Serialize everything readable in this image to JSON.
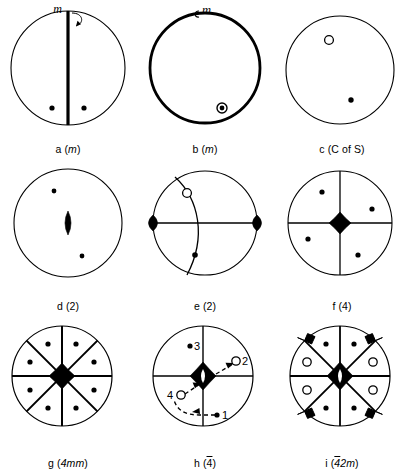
{
  "figure": {
    "rows": 3,
    "columns": 3,
    "background_color": "#ffffff",
    "line_color": "#000000"
  },
  "panels": [
    {
      "id": "a",
      "caption_letter": "a",
      "caption_symbol": "m",
      "caption_full": "a (m)",
      "symmetry": "m",
      "annotation_label": "m",
      "description": "circle with vertical mirror line and two related points",
      "circle_stroke_px": 1,
      "points": [
        {
          "type": "filled-dot",
          "label": ""
        },
        {
          "type": "filled-dot",
          "label": ""
        }
      ]
    },
    {
      "id": "b",
      "caption_letter": "b",
      "caption_symbol": "m",
      "caption_full": "b (m)",
      "symmetry": "m",
      "annotation_label": "m",
      "description": "bold circle (mirror plane in plane of page) with superimposed point pair",
      "circle_stroke_px": 2.6,
      "points": [
        {
          "type": "dot-in-ring",
          "label": ""
        }
      ]
    },
    {
      "id": "c",
      "caption_letter": "c",
      "caption_symbol": "C of S",
      "caption_full": "c (C of S)",
      "symmetry": "centre of symmetry",
      "annotation_label": "",
      "description": "circle with one open circle and one filled dot related by inversion",
      "circle_stroke_px": 1,
      "points": [
        {
          "type": "open-circle",
          "label": ""
        },
        {
          "type": "filled-dot",
          "label": ""
        }
      ]
    },
    {
      "id": "d",
      "caption_letter": "d",
      "caption_symbol": "2",
      "caption_full": "d (2)",
      "symmetry": "2",
      "annotation_label": "",
      "description": "circle with 2-fold lens symbol at centre and two related dots",
      "circle_stroke_px": 1,
      "points": [
        {
          "type": "filled-dot",
          "label": ""
        },
        {
          "type": "filled-dot",
          "label": ""
        }
      ]
    },
    {
      "id": "e",
      "caption_letter": "e",
      "caption_symbol": "2",
      "caption_full": "e (2)",
      "symmetry": "2",
      "annotation_label": "",
      "description": "circle with horizontal in-plane 2-fold axis, great-circle arc, open circle above and filled dot below",
      "circle_stroke_px": 1,
      "points": [
        {
          "type": "open-circle",
          "label": ""
        },
        {
          "type": "filled-dot",
          "label": ""
        }
      ]
    },
    {
      "id": "f",
      "caption_letter": "f",
      "caption_symbol": "4",
      "caption_full": "f (4)",
      "symmetry": "4",
      "annotation_label": "",
      "description": "circle with vertical and horizontal lines, 4-fold diamond at centre, four dots",
      "circle_stroke_px": 1,
      "points": [
        {
          "type": "filled-dot",
          "label": ""
        },
        {
          "type": "filled-dot",
          "label": ""
        },
        {
          "type": "filled-dot",
          "label": ""
        },
        {
          "type": "filled-dot",
          "label": ""
        }
      ]
    },
    {
      "id": "g",
      "caption_letter": "g",
      "caption_symbol": "4mm",
      "caption_full": "g (4mm)",
      "symmetry": "4mm",
      "annotation_label": "",
      "description": "circle with eight sectors, 4-fold diamond at centre and eight dots",
      "circle_stroke_px": 1,
      "points": [
        {
          "type": "filled-dot",
          "label": ""
        },
        {
          "type": "filled-dot",
          "label": ""
        },
        {
          "type": "filled-dot",
          "label": ""
        },
        {
          "type": "filled-dot",
          "label": ""
        },
        {
          "type": "filled-dot",
          "label": ""
        },
        {
          "type": "filled-dot",
          "label": ""
        },
        {
          "type": "filled-dot",
          "label": ""
        },
        {
          "type": "filled-dot",
          "label": ""
        }
      ]
    },
    {
      "id": "h",
      "caption_letter": "h",
      "caption_symbol": "4",
      "caption_symbol_overline": true,
      "caption_full": "h (4̄)",
      "symmetry": "4-bar",
      "annotation_label": "",
      "description": "circle with 4-bar axis at centre, four numbered points joined by dashed arrows",
      "circle_stroke_px": 1,
      "points": [
        {
          "type": "filled-dot",
          "label": "1"
        },
        {
          "type": "open-circle",
          "label": "2"
        },
        {
          "type": "filled-dot",
          "label": "3"
        },
        {
          "type": "open-circle",
          "label": "4"
        }
      ]
    },
    {
      "id": "i",
      "caption_letter": "i",
      "caption_symbol": "42m",
      "caption_symbol_overline_first": true,
      "caption_full": "i (4̄2m)",
      "symmetry": "4-bar 2 m",
      "annotation_label": "",
      "description": "circle with eight sectors, 4-bar centre, four filled dots, four open circles and four diagonal 2-fold lens markers on the rim",
      "circle_stroke_px": 1,
      "points": [
        {
          "type": "filled-dot",
          "label": ""
        },
        {
          "type": "filled-dot",
          "label": ""
        },
        {
          "type": "filled-dot",
          "label": ""
        },
        {
          "type": "filled-dot",
          "label": ""
        },
        {
          "type": "open-circle",
          "label": ""
        },
        {
          "type": "open-circle",
          "label": ""
        },
        {
          "type": "open-circle",
          "label": ""
        },
        {
          "type": "open-circle",
          "label": ""
        }
      ]
    }
  ],
  "numeric_labels": {
    "h_point_1": "1",
    "h_point_2": "2",
    "h_point_3": "3",
    "h_point_4": "4"
  }
}
